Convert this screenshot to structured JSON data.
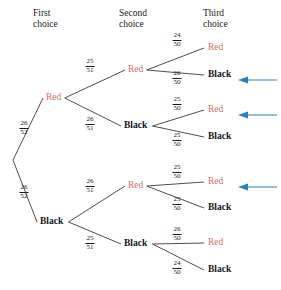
{
  "headers": [
    {
      "label": "First\nchoice",
      "x": 33,
      "y": 8
    },
    {
      "label": "Second\nchoice",
      "x": 119,
      "y": 8
    },
    {
      "label": "Third\nchoice",
      "x": 203,
      "y": 8
    }
  ],
  "colors": {
    "red": "#d4706a",
    "black": "#141414",
    "line": "#3a3a3a",
    "arrow": "#2b7fc4",
    "background": "#ffffff"
  },
  "chart_data": {
    "type": "diagram",
    "subtitle": "Drawing cards without replacement from a 52-card deck",
    "stages": [
      "First choice",
      "Second choice",
      "Third choice"
    ],
    "root": {
      "x": 11,
      "y": 160
    },
    "level1": [
      {
        "id": "R",
        "label": "Red",
        "color": "red",
        "x": 46,
        "y": 98,
        "prob": {
          "num": "26",
          "den": "52"
        },
        "frac_x": 24,
        "frac_y": 128
      },
      {
        "id": "B",
        "label": "Black",
        "color": "black",
        "x": 40,
        "y": 222,
        "prob": {
          "num": "26",
          "den": "52"
        },
        "frac_x": 24,
        "frac_y": 192
      }
    ],
    "level2": [
      {
        "id": "RR",
        "parent": "R",
        "label": "Red",
        "color": "red",
        "x": 128,
        "y": 70,
        "prob": {
          "num": "25",
          "den": "51"
        },
        "frac_x": 90,
        "frac_y": 66
      },
      {
        "id": "RB",
        "parent": "R",
        "label": "Black",
        "color": "black",
        "x": 124,
        "y": 126,
        "prob": {
          "num": "26",
          "den": "51"
        },
        "frac_x": 90,
        "frac_y": 124
      },
      {
        "id": "BR",
        "parent": "B",
        "label": "Red",
        "color": "red",
        "x": 128,
        "y": 186,
        "prob": {
          "num": "26",
          "den": "51"
        },
        "frac_x": 90,
        "frac_y": 186
      },
      {
        "id": "BB",
        "parent": "B",
        "label": "Black",
        "color": "black",
        "x": 124,
        "y": 244,
        "prob": {
          "num": "25",
          "den": "51"
        },
        "frac_x": 90,
        "frac_y": 243
      }
    ],
    "level3": [
      {
        "id": "RRR",
        "parent": "RR",
        "label": "Red",
        "color": "red",
        "x": 208,
        "y": 48,
        "prob": {
          "num": "24",
          "den": "50"
        },
        "frac_x": 177,
        "frac_y": 40,
        "arrow": false
      },
      {
        "id": "RRB",
        "parent": "RR",
        "label": "Black",
        "color": "black",
        "x": 208,
        "y": 75,
        "prob": {
          "num": "26",
          "den": "50"
        },
        "frac_x": 177,
        "frac_y": 78,
        "arrow": true
      },
      {
        "id": "RBR",
        "parent": "RB",
        "label": "Red",
        "color": "red",
        "x": 208,
        "y": 110,
        "prob": {
          "num": "25",
          "den": "50"
        },
        "frac_x": 177,
        "frac_y": 104,
        "arrow": true
      },
      {
        "id": "RBB",
        "parent": "RB",
        "label": "Black",
        "color": "black",
        "x": 208,
        "y": 137,
        "prob": {
          "num": "25",
          "den": "50"
        },
        "frac_x": 177,
        "frac_y": 140,
        "arrow": false
      },
      {
        "id": "BRR",
        "parent": "BR",
        "label": "Red",
        "color": "red",
        "x": 208,
        "y": 182,
        "prob": {
          "num": "25",
          "den": "50"
        },
        "frac_x": 177,
        "frac_y": 172,
        "arrow": true
      },
      {
        "id": "BRB",
        "parent": "BR",
        "label": "Black",
        "color": "black",
        "x": 208,
        "y": 208,
        "prob": {
          "num": "25",
          "den": "50"
        },
        "frac_x": 177,
        "frac_y": 204,
        "arrow": false
      },
      {
        "id": "BBR",
        "parent": "BB",
        "label": "Red",
        "color": "red",
        "x": 208,
        "y": 243,
        "prob": {
          "num": "26",
          "den": "50"
        },
        "frac_x": 177,
        "frac_y": 234,
        "arrow": false
      },
      {
        "id": "BBB",
        "parent": "BB",
        "label": "Black",
        "color": "black",
        "x": 208,
        "y": 270,
        "prob": {
          "num": "24",
          "den": "50"
        },
        "frac_x": 177,
        "frac_y": 268,
        "arrow": false
      }
    ],
    "arrow": {
      "x_tail": 277,
      "x_head": 238,
      "note": "points left at outcomes"
    }
  }
}
